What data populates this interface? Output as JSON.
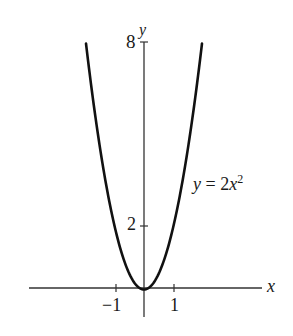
{
  "chart_data": {
    "type": "line",
    "title": "",
    "xlabel": "x",
    "ylabel": "y",
    "curve_label_parts": {
      "prefix": "y = 2",
      "var": "x",
      "exp": "2"
    },
    "function": "y = 2x^2",
    "x_ticks": [
      -1,
      1
    ],
    "x_tick_labels": [
      "−1",
      "1"
    ],
    "y_ticks": [
      2,
      8
    ],
    "y_tick_labels": [
      "2",
      "8"
    ],
    "xlim": [
      -4.0,
      4.1
    ],
    "ylim": [
      -1,
      8
    ],
    "grid": false,
    "legend": "none",
    "series": [
      {
        "name": "y = 2x^2",
        "x": [
          -2,
          -1.5,
          -1,
          -0.5,
          0,
          0.5,
          1,
          1.5,
          2
        ],
        "y": [
          8,
          4.5,
          2,
          0.5,
          0,
          0.5,
          2,
          4.5,
          8
        ]
      }
    ]
  },
  "colors": {
    "axis": "#333333",
    "curve": "#111111",
    "background": "#ffffff"
  }
}
